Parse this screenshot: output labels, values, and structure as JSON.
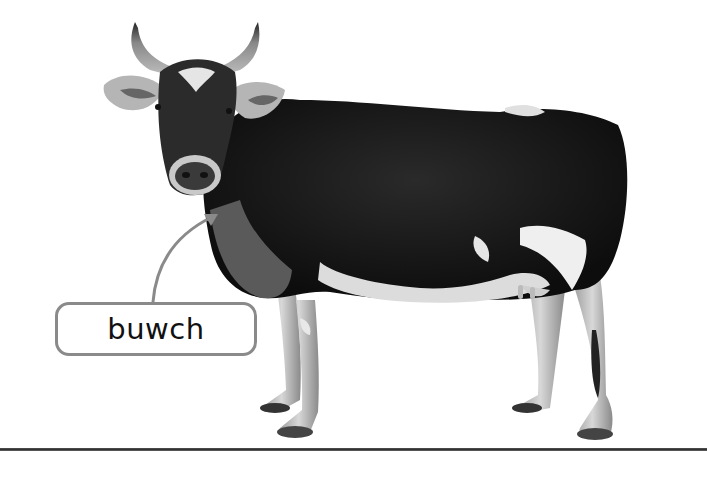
{
  "scene": {
    "subject": "cow",
    "colors": {
      "background": "#ffffff",
      "label_border": "#8a8a8a",
      "pointer": "#8a8a8a",
      "ground_line": "#444444",
      "text": "#111111"
    }
  },
  "label": {
    "text": "buwch"
  }
}
